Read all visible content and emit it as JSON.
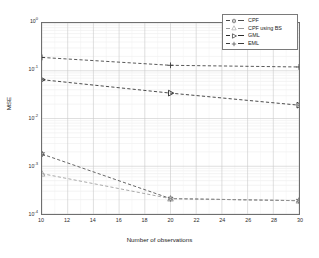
{
  "figure": {
    "background": "#ffffff",
    "frame_color": "#6f6f6f"
  },
  "axis": {
    "xlabel": "Number of observations",
    "ylabel": "MSE",
    "xticks": [
      "10",
      "12",
      "14",
      "16",
      "18",
      "20",
      "22",
      "24",
      "26",
      "28",
      "30"
    ],
    "yticks": [
      {
        "mantissa": "10",
        "exponent": "0"
      },
      {
        "mantissa": "10",
        "exponent": "-1"
      },
      {
        "mantissa": "10",
        "exponent": "-2"
      },
      {
        "mantissa": "10",
        "exponent": "-3"
      },
      {
        "mantissa": "10",
        "exponent": "-4"
      }
    ]
  },
  "legend": {
    "position": "top-right",
    "items": [
      {
        "label": "CPF",
        "marker": "hexagram-marker",
        "color": "#4a4a4a"
      },
      {
        "label": "CPF using BS",
        "marker": "triangle-up-marker",
        "color": "#9a9a9a"
      },
      {
        "label": "GML",
        "marker": "triangle-right-marker",
        "color": "#2a2a2a"
      },
      {
        "label": "EML",
        "marker": "plus-marker",
        "color": "#3a3a3a"
      }
    ]
  },
  "chart_data": {
    "type": "line",
    "title": "",
    "xlabel": "Number of observations",
    "ylabel": "MSE",
    "xscale": "linear",
    "yscale": "log",
    "xlim": [
      10,
      30
    ],
    "ylim": [
      0.0001,
      1
    ],
    "grid": true,
    "x": [
      10,
      20,
      30
    ],
    "series": [
      {
        "name": "CPF",
        "marker": "hexagram-marker",
        "linestyle": "dashed",
        "color": "#4a4a4a",
        "values": [
          0.0018,
          0.00021,
          0.00019
        ]
      },
      {
        "name": "CPF using BS",
        "marker": "triangle-up-marker",
        "linestyle": "dashed",
        "color": "#9a9a9a",
        "values": [
          0.0007,
          0.00021,
          0.00019
        ]
      },
      {
        "name": "GML",
        "marker": "triangle-right-marker",
        "linestyle": "dashed",
        "color": "#2a2a2a",
        "values": [
          0.065,
          0.034,
          0.019
        ]
      },
      {
        "name": "EML",
        "marker": "plus-marker",
        "linestyle": "dashed",
        "color": "#3a3a3a",
        "values": [
          0.19,
          0.13,
          0.12
        ]
      }
    ]
  }
}
